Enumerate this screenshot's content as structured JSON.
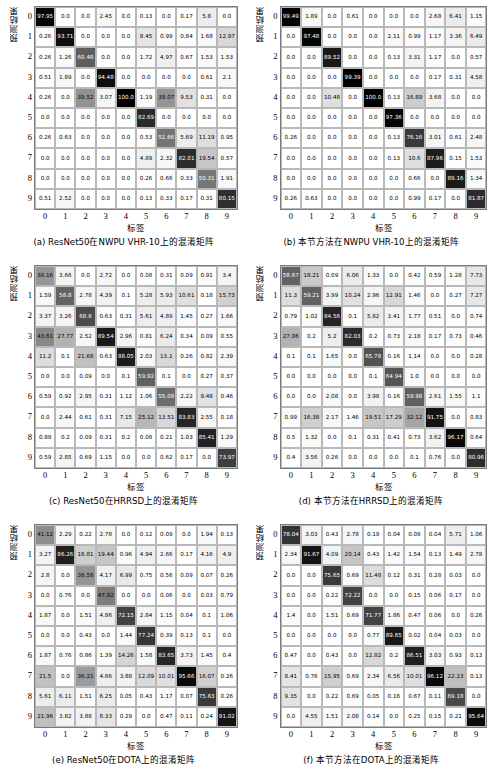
{
  "figure": {
    "axis_y_label": "预测结果",
    "axis_x_label": "标签",
    "tick_labels": [
      "0",
      "1",
      "2",
      "3",
      "4",
      "5",
      "6",
      "7",
      "8",
      "9"
    ],
    "colormap": "greyscale-inverted"
  },
  "panels": [
    {
      "id": "a",
      "caption": "(a)  ResNet50在NWPU VHR-10上的混淆矩阵",
      "chart_data": {
        "type": "heatmap",
        "title": "(a)  ResNet50在NWPU VHR-10上的混淆矩阵",
        "xlabel": "标签",
        "ylabel": "预测结果",
        "xticks": [
          "0",
          "1",
          "2",
          "3",
          "4",
          "5",
          "6",
          "7",
          "8",
          "9"
        ],
        "yticks": [
          "0",
          "1",
          "2",
          "3",
          "4",
          "5",
          "6",
          "7",
          "8",
          "9"
        ],
        "zlim": [
          0,
          100
        ],
        "values": [
          [
            97.95,
            0.0,
            0.0,
            2.45,
            0.0,
            0.13,
            0.0,
            0.17,
            5.8,
            0.0
          ],
          [
            0.26,
            93.71,
            0.0,
            0.0,
            0.0,
            8.45,
            0.99,
            0.84,
            1.68,
            12.97
          ],
          [
            0.26,
            1.26,
            60.48,
            0.0,
            0.0,
            1.72,
            4.97,
            0.67,
            1.53,
            1.53
          ],
          [
            0.51,
            1.89,
            0.0,
            94.48,
            0.0,
            0.0,
            0.0,
            0.0,
            0.61,
            2.1
          ],
          [
            0.26,
            0.0,
            39.52,
            3.07,
            100.0,
            1.19,
            39.07,
            9.53,
            0.31,
            0.0
          ],
          [
            0.0,
            0.0,
            0.0,
            0.0,
            0.0,
            82.69,
            0.0,
            0.0,
            0.0,
            0.0
          ],
          [
            0.26,
            0.63,
            0.0,
            0.0,
            0.0,
            0.53,
            51.66,
            5.69,
            11.19,
            0.95
          ],
          [
            0.0,
            0.0,
            0.0,
            0.0,
            0.0,
            4.89,
            2.32,
            82.01,
            19.54,
            0.57
          ],
          [
            0.0,
            0.0,
            0.0,
            0.0,
            0.0,
            0.26,
            0.66,
            0.33,
            50.31,
            1.91
          ],
          [
            0.51,
            2.52,
            0.0,
            0.0,
            0.0,
            0.13,
            0.33,
            0.17,
            0.31,
            80.15
          ]
        ]
      }
    },
    {
      "id": "b",
      "caption": "(b)  本节方法在NWPU VHR-10上的混淆矩阵",
      "chart_data": {
        "type": "heatmap",
        "title": "(b)  本节方法在NWPU VHR-10上的混淆矩阵",
        "xlabel": "标签",
        "ylabel": "预测结果",
        "xticks": [
          "0",
          "1",
          "2",
          "3",
          "4",
          "5",
          "6",
          "7",
          "8",
          "9"
        ],
        "yticks": [
          "0",
          "1",
          "2",
          "3",
          "4",
          "5",
          "6",
          "7",
          "8",
          "9"
        ],
        "zlim": [
          0,
          100
        ],
        "values": [
          [
            99.49,
            1.89,
            0.0,
            0.61,
            0.0,
            0.0,
            0.0,
            2.68,
            6.41,
            1.15
          ],
          [
            0.0,
            97.48,
            0.0,
            0.0,
            0.0,
            2.11,
            0.99,
            1.17,
            3.36,
            6.49
          ],
          [
            0.0,
            0.0,
            89.52,
            0.0,
            0.0,
            0.13,
            3.31,
            1.17,
            0.0,
            0.57
          ],
          [
            0.0,
            0.0,
            0.0,
            99.39,
            0.0,
            0.0,
            0.0,
            0.17,
            0.31,
            4.58
          ],
          [
            0.0,
            0.0,
            10.48,
            0.0,
            100.0,
            0.13,
            16.89,
            3.68,
            0.0,
            0.0
          ],
          [
            0.0,
            0.0,
            0.0,
            0.0,
            0.0,
            97.36,
            0.0,
            0.0,
            0.0,
            0.0
          ],
          [
            0.26,
            0.0,
            0.0,
            0.0,
            0.0,
            0.13,
            76.16,
            3.01,
            0.61,
            2.48
          ],
          [
            0.0,
            0.0,
            0.0,
            0.0,
            0.0,
            0.13,
            10.6,
            87.96,
            0.15,
            1.53
          ],
          [
            0.0,
            0.0,
            0.0,
            0.0,
            0.0,
            0.0,
            0.66,
            0.0,
            89.16,
            1.34
          ],
          [
            0.26,
            0.63,
            0.0,
            0.0,
            0.0,
            0.0,
            0.99,
            0.17,
            0.0,
            81.87
          ]
        ]
      }
    },
    {
      "id": "c",
      "caption": "(c)  ResNet50在HRRSD上的混淆矩阵",
      "chart_data": {
        "type": "heatmap",
        "title": "(c)  ResNet50在HRRSD上的混淆矩阵",
        "xlabel": "标签",
        "ylabel": "预测结果",
        "xticks": [
          "0",
          "1",
          "2",
          "3",
          "4",
          "5",
          "6",
          "7",
          "8",
          "9"
        ],
        "yticks": [
          "0",
          "1",
          "2",
          "3",
          "4",
          "5",
          "6",
          "7",
          "8",
          "9"
        ],
        "zlim": [
          0,
          100
        ],
        "values": [
          [
            38.16,
            3.66,
            0.0,
            2.72,
            0.0,
            0.08,
            0.31,
            0.09,
            0.91,
            3.4
          ],
          [
            1.59,
            58.8,
            2.78,
            4.39,
            0.1,
            5.28,
            5.93,
            10.61,
            0.18,
            15.73
          ],
          [
            3.37,
            3.26,
            68.6,
            0.63,
            0.31,
            5.61,
            4.89,
            1.45,
            0.27,
            1.66
          ],
          [
            43.61,
            27.77,
            2.52,
            89.54,
            2.96,
            0.81,
            6.24,
            0.34,
            0.09,
            0.55
          ],
          [
            11.2,
            0.1,
            21.68,
            0.63,
            88.05,
            2.03,
            13.1,
            0.26,
            0.82,
            2.39
          ],
          [
            0.0,
            0.0,
            0.09,
            0.0,
            0.1,
            59.92,
            0.1,
            0.0,
            0.27,
            0.37
          ],
          [
            0.59,
            0.92,
            2.95,
            0.31,
            1.12,
            1.06,
            55.09,
            2.22,
            9.48,
            0.46
          ],
          [
            0.0,
            2.44,
            0.61,
            0.31,
            7.15,
            25.12,
            13.51,
            83.83,
            2.55,
            0.18
          ],
          [
            0.89,
            0.2,
            0.09,
            0.31,
            0.2,
            0.08,
            0.21,
            1.03,
            85.41,
            1.29
          ],
          [
            0.59,
            2.85,
            0.69,
            1.15,
            0.0,
            0.0,
            0.62,
            0.17,
            0.0,
            73.97
          ]
        ]
      }
    },
    {
      "id": "d",
      "caption": "(d)  本节方法在HRRSD上的混淆矩阵",
      "chart_data": {
        "type": "heatmap",
        "title": "(d)  本节方法在HRRSD上的混淆矩阵",
        "xlabel": "标签",
        "ylabel": "预测结果",
        "xticks": [
          "0",
          "1",
          "2",
          "3",
          "4",
          "5",
          "6",
          "7",
          "8",
          "9"
        ],
        "yticks": [
          "0",
          "1",
          "2",
          "3",
          "4",
          "5",
          "6",
          "7",
          "8",
          "9"
        ],
        "zlim": [
          0,
          100
        ],
        "values": [
          [
            58.67,
            18.21,
            0.09,
            6.06,
            1.33,
            0.0,
            0.42,
            0.59,
            1.28,
            7.73
          ],
          [
            11.3,
            59.21,
            3.99,
            10.24,
            2.96,
            12.91,
            1.46,
            0.0,
            0.27,
            7.27
          ],
          [
            0.79,
            1.02,
            84.56,
            0.1,
            5.82,
            3.41,
            1.77,
            0.51,
            0.0,
            0.74
          ],
          [
            27.06,
            0.2,
            5.2,
            82.03,
            0.2,
            0.73,
            2.18,
            0.17,
            0.73,
            0.46
          ],
          [
            0.1,
            0.1,
            1.65,
            0.0,
            65.78,
            0.16,
            1.14,
            0.0,
            0.0,
            0.28
          ],
          [
            0.0,
            0.0,
            0.0,
            0.0,
            0.1,
            64.94,
            1.0,
            0.0,
            0.0,
            0.0
          ],
          [
            0.0,
            0.0,
            2.08,
            0.0,
            3.98,
            0.16,
            59.98,
            2.61,
            1.55,
            1.1
          ],
          [
            0.99,
            16.38,
            2.17,
            1.46,
            19.51,
            17.29,
            32.12,
            91.75,
            0.0,
            0.83
          ],
          [
            0.5,
            1.32,
            0.0,
            0.1,
            0.31,
            0.41,
            0.73,
            3.62,
            96.17,
            0.64
          ],
          [
            0.4,
            3.56,
            0.26,
            0.0,
            0.0,
            0.0,
            0.1,
            0.76,
            0.0,
            80.96
          ]
        ]
      }
    },
    {
      "id": "e",
      "caption": "(e)  ResNet50在DOTA上的混淆矩阵",
      "chart_data": {
        "type": "heatmap",
        "title": "(e)  ResNet50在DOTA上的混淆矩阵",
        "xlabel": "标签",
        "ylabel": "预测结果",
        "xticks": [
          "0",
          "1",
          "2",
          "3",
          "4",
          "5",
          "6",
          "7",
          "8",
          "9"
        ],
        "yticks": [
          "0",
          "1",
          "2",
          "3",
          "4",
          "5",
          "6",
          "7",
          "8",
          "9"
        ],
        "zlim": [
          0,
          100
        ],
        "values": [
          [
            41.12,
            2.29,
            0.22,
            2.78,
            0.0,
            0.12,
            0.09,
            0.0,
            1.94,
            0.13
          ],
          [
            3.27,
            86.26,
            16.81,
            19.44,
            0.96,
            4.94,
            2.66,
            0.17,
            4.16,
            4.9
          ],
          [
            2.8,
            0.0,
            38.58,
            4.17,
            6.99,
            0.75,
            0.56,
            0.09,
            0.07,
            0.26
          ],
          [
            0.0,
            0.76,
            0.0,
            47.92,
            0.0,
            0.0,
            0.06,
            0.0,
            0.03,
            0.79
          ],
          [
            1.87,
            0.0,
            1.51,
            4.86,
            72.15,
            2.84,
            1.15,
            0.04,
            0.1,
            1.06
          ],
          [
            0.0,
            0.0,
            0.43,
            0.0,
            1.44,
            77.24,
            0.39,
            0.13,
            0.1,
            0.0
          ],
          [
            1.87,
            0.76,
            0.86,
            1.39,
            14.26,
            1.58,
            83.65,
            3.73,
            1.45,
            0.4
          ],
          [
            21.5,
            0.0,
            36.21,
            4.86,
            3.88,
            12.09,
            10.01,
            95.66,
            16.07,
            0.26
          ],
          [
            5.61,
            6.11,
            1.51,
            6.25,
            0.05,
            0.43,
            1.17,
            0.07,
            75.83,
            0.26
          ],
          [
            21.96,
            3.82,
            3.88,
            8.33,
            0.29,
            0.0,
            0.47,
            0.11,
            0.24,
            91.02
          ]
        ]
      }
    },
    {
      "id": "f",
      "caption": "(f)  本节方法在DOTA上的混淆矩阵",
      "chart_data": {
        "type": "heatmap",
        "title": "(f)  本节方法在DOTA上的混淆矩阵",
        "xlabel": "标签",
        "ylabel": "预测结果",
        "xticks": [
          "0",
          "1",
          "2",
          "3",
          "4",
          "5",
          "6",
          "7",
          "8",
          "9"
        ],
        "yticks": [
          "0",
          "1",
          "2",
          "3",
          "4",
          "5",
          "6",
          "7",
          "8",
          "9"
        ],
        "zlim": [
          0,
          100
        ],
        "values": [
          [
            78.04,
            3.03,
            0.43,
            2.78,
            0.19,
            0.04,
            0.08,
            0.04,
            5.71,
            1.06
          ],
          [
            2.34,
            91.67,
            4.09,
            20.14,
            0.43,
            1.42,
            1.54,
            0.13,
            1.49,
            2.78
          ],
          [
            0.0,
            0.0,
            75.65,
            0.69,
            11.48,
            0.12,
            0.31,
            0.28,
            0.03,
            0.0
          ],
          [
            0.0,
            0.0,
            0.22,
            72.22,
            0.0,
            0.0,
            0.15,
            0.06,
            0.17,
            0.0
          ],
          [
            1.4,
            0.0,
            1.51,
            0.69,
            71.77,
            1.86,
            0.47,
            0.06,
            0.0,
            0.26
          ],
          [
            0.0,
            0.0,
            0.0,
            0.0,
            0.77,
            89.65,
            0.02,
            0.04,
            0.03,
            0.0
          ],
          [
            0.47,
            0.0,
            0.43,
            0.0,
            12.82,
            0.2,
            86.51,
            3.03,
            0.93,
            0.13
          ],
          [
            8.41,
            0.76,
            15.95,
            0.69,
            2.34,
            6.56,
            10.01,
            96.12,
            22.23,
            0.13
          ],
          [
            9.35,
            0.0,
            0.22,
            0.69,
            0.05,
            0.16,
            0.67,
            0.11,
            69.18,
            0.0
          ],
          [
            0.0,
            4.55,
            1.51,
            2.08,
            0.14,
            0.0,
            0.25,
            0.15,
            0.21,
            95.64
          ]
        ]
      }
    }
  ]
}
